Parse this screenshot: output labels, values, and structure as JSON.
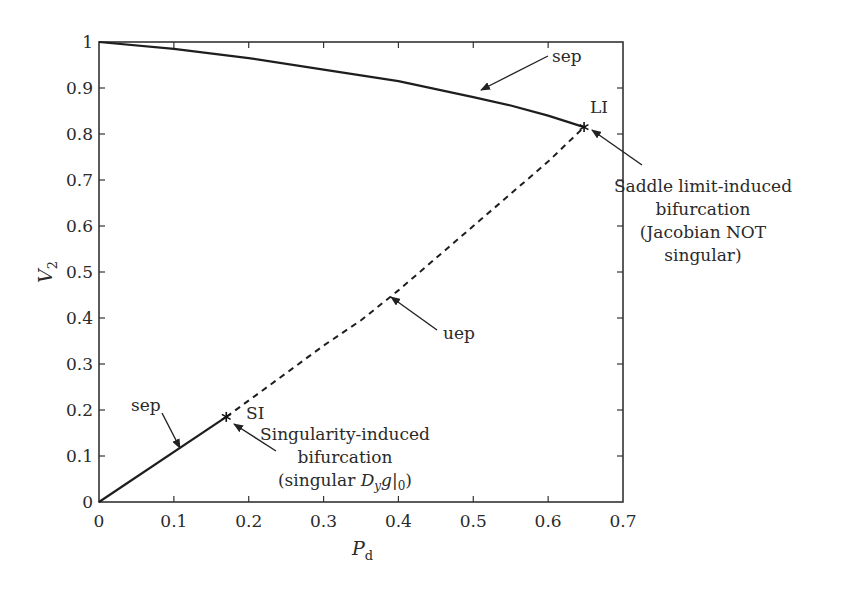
{
  "chart_data": {
    "type": "line",
    "title": "",
    "xlabel": "P_d",
    "ylabel": "V_2",
    "xlim": [
      0,
      0.7
    ],
    "ylim": [
      0,
      1
    ],
    "grid": false,
    "legend": null,
    "x_ticks": [
      "0",
      "0.1",
      "0.2",
      "0.3",
      "0.4",
      "0.5",
      "0.6",
      "0.7"
    ],
    "y_ticks": [
      "0",
      "0.1",
      "0.2",
      "0.3",
      "0.4",
      "0.5",
      "0.6",
      "0.7",
      "0.8",
      "0.9",
      "1"
    ],
    "series": [
      {
        "name": "sep (upper branch)",
        "style": "solid",
        "x": [
          0,
          0.1,
          0.2,
          0.3,
          0.4,
          0.5,
          0.55,
          0.6,
          0.648
        ],
        "y": [
          1.0,
          0.985,
          0.965,
          0.94,
          0.915,
          0.88,
          0.862,
          0.84,
          0.815
        ]
      },
      {
        "name": "uep",
        "style": "dashed",
        "x": [
          0.17,
          0.25,
          0.3,
          0.35,
          0.4,
          0.45,
          0.5,
          0.55,
          0.6,
          0.648
        ],
        "y": [
          0.185,
          0.28,
          0.34,
          0.395,
          0.46,
          0.53,
          0.6,
          0.67,
          0.74,
          0.815
        ]
      },
      {
        "name": "sep (lower branch)",
        "style": "solid",
        "x": [
          0,
          0.17
        ],
        "y": [
          0,
          0.185
        ]
      }
    ],
    "markers": [
      {
        "name": "LI",
        "symbol": "*",
        "x": 0.648,
        "y": 0.815
      },
      {
        "name": "SI",
        "symbol": "*",
        "x": 0.17,
        "y": 0.185
      }
    ],
    "annotations": [
      {
        "id": "sep_upper",
        "text": "sep",
        "points_to": [
          0.508,
          0.896
        ]
      },
      {
        "id": "li",
        "text": "LI"
      },
      {
        "id": "saddle",
        "lines": [
          "Saddle limit-induced",
          "bifurcation",
          "(Jacobian NOT",
          "singular)"
        ],
        "points_to": [
          0.66,
          0.81
        ]
      },
      {
        "id": "uep",
        "text": "uep",
        "points_to": [
          0.389,
          0.446
        ]
      },
      {
        "id": "sep_lower",
        "text": "sep",
        "points_to": [
          0.108,
          0.117
        ]
      },
      {
        "id": "si",
        "text": "SI"
      },
      {
        "id": "singularity",
        "lines": [
          "Singularity-induced",
          "bifurcation",
          "(singular D_y g|_0)"
        ],
        "points_to": [
          0.18,
          0.17
        ]
      }
    ]
  },
  "labels": {
    "xlabel_main": "P",
    "xlabel_sub": "d",
    "ylabel_main": "V",
    "ylabel_sub": "2",
    "sep_upper": "sep",
    "sep_lower": "sep",
    "li": "LI",
    "si": "SI",
    "uep": "uep",
    "saddle_1": "Saddle limit-induced",
    "saddle_2": "bifurcation",
    "saddle_3": "(Jacobian NOT",
    "saddle_4": "singular)",
    "sing_1": "Singularity-induced",
    "sing_2": "bifurcation",
    "sing_3a": "(singular ",
    "sing_3_D": "D",
    "sing_3_y": "y",
    "sing_3_g": "g",
    "sing_3_bar": "|",
    "sing_3_0": "0",
    "sing_3_close": ")"
  }
}
